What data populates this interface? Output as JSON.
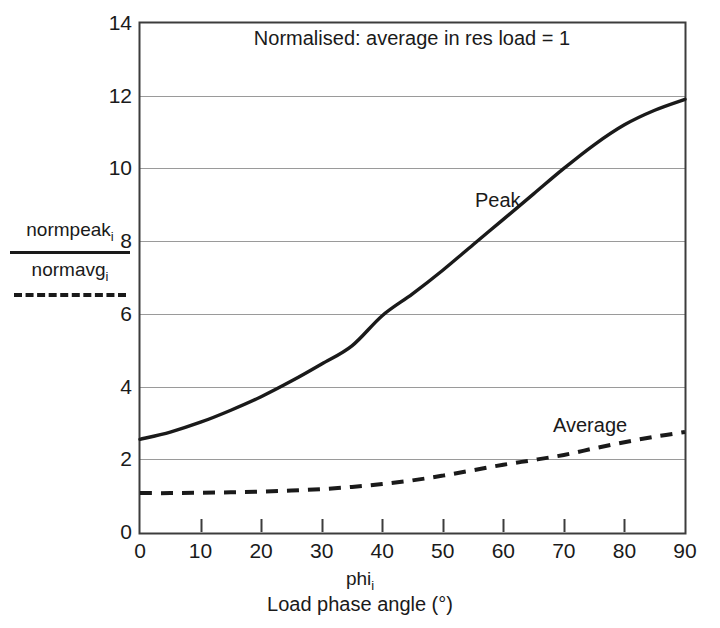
{
  "chart_data": {
    "type": "line",
    "title": "Normalised: average in res load = 1",
    "xlabel": "Load phase angle (°)",
    "xlabel_symbol": "phi",
    "xlabel_symbol_sub": "i",
    "ylabel_numerator": "normpeak",
    "ylabel_numerator_sub": "i",
    "ylabel_denominator": "normavg",
    "ylabel_denominator_sub": "i",
    "xlim": [
      0,
      90
    ],
    "ylim": [
      0,
      14
    ],
    "xticks": [
      0,
      10,
      20,
      30,
      40,
      50,
      60,
      70,
      80,
      90
    ],
    "yticks": [
      0,
      2,
      4,
      6,
      8,
      10,
      12,
      14
    ],
    "grid": "horizontal",
    "legend_position": "in-plot-annotations",
    "x": [
      0,
      5,
      10,
      15,
      20,
      25,
      30,
      35,
      40,
      45,
      50,
      55,
      60,
      65,
      70,
      75,
      80,
      85,
      90
    ],
    "series": [
      {
        "name": "Peak",
        "style": "solid",
        "color": "#1a1a1a",
        "values": [
          2.55,
          2.75,
          3.02,
          3.35,
          3.72,
          4.15,
          4.62,
          5.12,
          5.95,
          6.55,
          7.2,
          7.9,
          8.6,
          9.3,
          10.0,
          10.65,
          11.2,
          11.6,
          11.9
        ]
      },
      {
        "name": "Average",
        "style": "dashed",
        "color": "#1a1a1a",
        "values": [
          1.07,
          1.07,
          1.08,
          1.09,
          1.11,
          1.14,
          1.18,
          1.24,
          1.32,
          1.42,
          1.55,
          1.7,
          1.85,
          1.98,
          2.12,
          2.3,
          2.47,
          2.62,
          2.75
        ]
      }
    ],
    "annotations": [
      {
        "text": "Peak",
        "x": 63,
        "y": 8.9
      },
      {
        "text": "Average",
        "x": 84,
        "y": 3.3
      }
    ]
  },
  "axis": {
    "y_tick_labels": [
      "14",
      "12",
      "10",
      "8",
      "6",
      "4",
      "2",
      "0"
    ],
    "x_tick_labels": [
      "0",
      "10",
      "20",
      "30",
      "40",
      "50",
      "60",
      "70",
      "80",
      "90"
    ]
  },
  "colors": {
    "series": "#1a1a1a",
    "frame": "#3c3c3c",
    "grid": "#9a9a9a",
    "background": "#ffffff"
  }
}
